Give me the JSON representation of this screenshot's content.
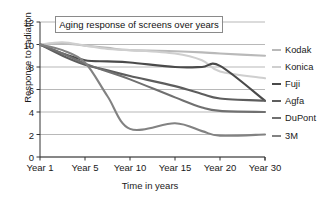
{
  "chart_data": {
    "type": "line",
    "title": "Aging response of screens over years",
    "xlabel": "Time in years",
    "ylabel": "Response to radiation",
    "x_tick_labels": [
      "Year 1",
      "Year 5",
      "Year 10",
      "Year 15",
      "Year 20",
      "Year 30"
    ],
    "x_positions": [
      1,
      5,
      10,
      15,
      20,
      30
    ],
    "y_tick_labels": [
      "0",
      "2",
      "4",
      "6",
      "8",
      "10",
      "12"
    ],
    "ylim": [
      0,
      12
    ],
    "grid": "horizontal",
    "legend_position": "right-outside",
    "series": [
      {
        "name": "Kodak",
        "color": "#b9b9b9",
        "values": [
          10.0,
          10.1,
          9.9,
          9.7,
          9.5,
          9.4,
          9.3,
          9.2,
          9.0
        ]
      },
      {
        "name": "Konica",
        "color": "#cfcfcf",
        "values": [
          10.0,
          10.2,
          9.9,
          9.6,
          9.5,
          9.2,
          8.6,
          7.6,
          7.0
        ]
      },
      {
        "name": "Fuji",
        "color": "#4a4a4a",
        "values": [
          10.0,
          9.2,
          8.6,
          8.5,
          8.4,
          8.0,
          8.0,
          8.1,
          5.0
        ]
      },
      {
        "name": "Agfa",
        "color": "#5d5d5d",
        "values": [
          10.0,
          9.0,
          8.2,
          7.7,
          7.2,
          6.3,
          5.6,
          5.2,
          5.0
        ]
      },
      {
        "name": "DuPont",
        "color": "#707070",
        "values": [
          10.0,
          9.2,
          8.3,
          7.6,
          6.9,
          5.3,
          4.4,
          4.1,
          4.0
        ]
      },
      {
        "name": "3M",
        "color": "#828282",
        "values": [
          10.0,
          9.5,
          8.4,
          5.4,
          2.5,
          3.0,
          2.3,
          1.9,
          2.0
        ]
      }
    ],
    "sample_x": [
      1,
      3,
      5,
      7.5,
      10,
      15,
      18,
      20,
      30
    ]
  },
  "legend": {
    "items": [
      {
        "label": "Kodak"
      },
      {
        "label": "Konica"
      },
      {
        "label": "Fuji"
      },
      {
        "label": "Agfa"
      },
      {
        "label": "DuPont"
      },
      {
        "label": "3M"
      }
    ]
  }
}
